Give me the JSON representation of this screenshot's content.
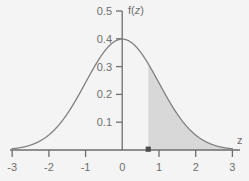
{
  "chart_data": {
    "type": "area",
    "title": "",
    "subtitle": "",
    "xlabel": "z",
    "ylabel": "f(z)",
    "xlim": [
      -3,
      3
    ],
    "ylim": [
      0,
      0.5
    ],
    "grid": false,
    "legend": null,
    "x_ticks": [
      "-3",
      "-2",
      "-1",
      "0",
      "1",
      "2",
      "3"
    ],
    "x_tick_values": [
      -3,
      -2,
      -1,
      0,
      1,
      2,
      3
    ],
    "y_ticks": [
      "0.1",
      "0.2",
      "0.3",
      "0.4",
      "0.5"
    ],
    "y_tick_values": [
      0.1,
      0.2,
      0.3,
      0.4,
      0.5
    ],
    "curve": {
      "name": "standard normal density",
      "formula": "f(z) = (1/sqrt(2*pi)) * exp(-z^2/2)",
      "peak_x": 0,
      "peak_y": 0.4,
      "color": "#808080"
    },
    "shaded_region": {
      "label": "upper tail area",
      "from_x": 0.71,
      "to_x": 3,
      "fill_color": "#d8d8d8"
    },
    "marker": {
      "label": "z cut point",
      "x": 0.71,
      "y": 0,
      "color": "#4d4d4d"
    },
    "points": [
      {
        "x": -3.0,
        "y": 0.0044
      },
      {
        "x": -2.5,
        "y": 0.0175
      },
      {
        "x": -2.0,
        "y": 0.054
      },
      {
        "x": -1.5,
        "y": 0.1295
      },
      {
        "x": -1.0,
        "y": 0.242
      },
      {
        "x": -0.5,
        "y": 0.3521
      },
      {
        "x": 0.0,
        "y": 0.3989
      },
      {
        "x": 0.5,
        "y": 0.3521
      },
      {
        "x": 0.71,
        "y": 0.3101
      },
      {
        "x": 1.0,
        "y": 0.242
      },
      {
        "x": 1.5,
        "y": 0.1295
      },
      {
        "x": 2.0,
        "y": 0.054
      },
      {
        "x": 2.5,
        "y": 0.0175
      },
      {
        "x": 3.0,
        "y": 0.0044
      }
    ]
  },
  "labels": {
    "y_top": "0.5",
    "y_04": "0.4",
    "y_03": "0.3",
    "y_02": "0.2",
    "y_01": "0.1",
    "x_m3": "-3",
    "x_m2": "-2",
    "x_m1": "-1",
    "x_0": "0",
    "x_1": "1",
    "x_2": "2",
    "x_3": "3",
    "y_axis_title_pre": "f(",
    "y_axis_title_var": "z",
    "y_axis_title_post": ")",
    "x_axis_title": "z"
  },
  "colors": {
    "background": "#f4f4f4",
    "axis": "#6e6e6e",
    "curve": "#808080",
    "fill": "#d8d8d8",
    "text": "#6e6e6e",
    "marker": "#4d4d4d"
  }
}
